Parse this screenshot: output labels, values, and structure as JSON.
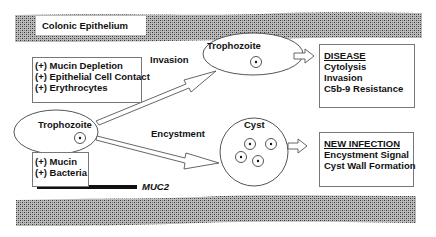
{
  "diagram": {
    "epithelium_label": "Colonic Epithelium",
    "invasion_label": "Invasion",
    "encystment_label": "Encystment",
    "trophozoite_start_label": "Trophozoite",
    "trophozoite_invasive_label": "Trophozoite",
    "cyst_label": "Cyst",
    "muc2_label": "MUC2",
    "invasion_triggers": [
      "(+) Mucin  Depletion",
      "(+) Epithelial Cell Contact",
      "(+) Erythrocytes"
    ],
    "encystment_triggers": [
      "(+) Mucin",
      "(+) Bacteria"
    ],
    "disease_box": {
      "title": "DISEASE",
      "items": [
        "Cytolysis",
        "Invasion",
        "C5b-9 Resistance"
      ]
    },
    "new_infection_box": {
      "title": "NEW INFECTION",
      "items": [
        "Encystment Signal",
        "Cyst Wall Formation"
      ]
    }
  }
}
